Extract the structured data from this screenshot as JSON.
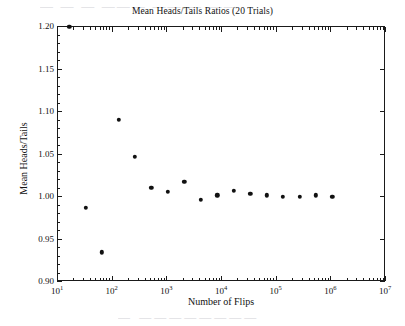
{
  "figure": {
    "background": "#ffffff",
    "ink": "#111111"
  },
  "artifacts": {
    "top_ghost_text": "—  —   —  ———   ——  —  ——",
    "bottom_ghost_text": "—   ————————"
  },
  "chart_data": {
    "type": "scatter",
    "title": "Mean Heads/Tails Ratios (20 Trials)",
    "xlabel": "Number of Flips",
    "ylabel": "Mean Heads/Tails",
    "xscale": "log",
    "yscale": "linear",
    "xlim": [
      10,
      10000000
    ],
    "ylim": [
      0.9,
      1.2
    ],
    "grid": false,
    "legend": null,
    "xtick_labels": [
      "10¹",
      "10²",
      "10³",
      "10⁴",
      "10⁵",
      "10⁶",
      "10⁷"
    ],
    "xtick_bases": [
      "10",
      "10",
      "10",
      "10",
      "10",
      "10",
      "10"
    ],
    "xtick_exponents": [
      "1",
      "2",
      "3",
      "4",
      "5",
      "6",
      "7"
    ],
    "xtick_values": [
      10,
      100,
      1000,
      10000,
      100000,
      1000000,
      10000000
    ],
    "ytick_labels": [
      "0.90",
      "0.95",
      "1.00",
      "1.05",
      "1.10",
      "1.15",
      "1.20"
    ],
    "ytick_values": [
      0.9,
      0.95,
      1.0,
      1.05,
      1.1,
      1.15,
      1.2
    ],
    "marker": "filled-circle",
    "marker_color": "#111111",
    "marker_size_px": 4.4,
    "x": [
      16,
      32,
      64,
      128,
      256,
      512,
      1024,
      2048,
      4096,
      8192,
      16384,
      32768,
      65536,
      131072,
      262144,
      524288,
      1048576
    ],
    "y": [
      1.2,
      0.987,
      0.935,
      1.091,
      1.047,
      1.011,
      1.006,
      1.018,
      0.997,
      1.002,
      1.007,
      1.004,
      1.002,
      1.0,
      1.0,
      1.002,
      1.0
    ],
    "points": [
      {
        "x": 16,
        "y": 1.2,
        "clipped_at_top": true
      },
      {
        "x": 32,
        "y": 0.987
      },
      {
        "x": 64,
        "y": 0.935
      },
      {
        "x": 128,
        "y": 1.091
      },
      {
        "x": 256,
        "y": 1.047
      },
      {
        "x": 512,
        "y": 1.011
      },
      {
        "x": 1024,
        "y": 1.006
      },
      {
        "x": 2048,
        "y": 1.018
      },
      {
        "x": 4096,
        "y": 0.997
      },
      {
        "x": 8192,
        "y": 1.002
      },
      {
        "x": 16384,
        "y": 1.007
      },
      {
        "x": 32768,
        "y": 1.004
      },
      {
        "x": 65536,
        "y": 1.002
      },
      {
        "x": 131072,
        "y": 1.0
      },
      {
        "x": 262144,
        "y": 1.0
      },
      {
        "x": 524288,
        "y": 1.002
      },
      {
        "x": 1048576,
        "y": 1.0
      }
    ]
  }
}
